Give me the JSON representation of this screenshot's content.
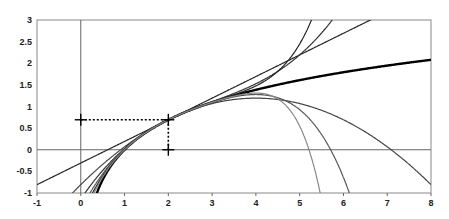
{
  "chart_data": {
    "type": "line",
    "title": "",
    "xlabel": "",
    "ylabel": "",
    "xlim": [
      -1,
      8
    ],
    "ylim": [
      -1,
      3
    ],
    "x_ticks": [
      "-1",
      "0",
      "1",
      "2",
      "3",
      "4",
      "5",
      "6",
      "7",
      "8"
    ],
    "y_ticks": [
      "3",
      "2.5",
      "2",
      "1.5",
      "1",
      "0.5",
      "0",
      "-0.5",
      "-1"
    ],
    "grid": false,
    "legend": null,
    "center_point": {
      "x": 2,
      "y": 0.693
    },
    "series": [
      {
        "name": "ln(x)",
        "order": 0,
        "style": "thick",
        "color": "#000000"
      },
      {
        "name": "T1",
        "order": 1,
        "color": "#222222"
      },
      {
        "name": "T2",
        "order": 2,
        "color": "#444444"
      },
      {
        "name": "T3",
        "order": 3,
        "color": "#333333"
      },
      {
        "name": "T4",
        "order": 4,
        "color": "#555555"
      },
      {
        "name": "T5",
        "order": 5,
        "color": "#222222"
      },
      {
        "name": "T6",
        "order": 6,
        "color": "#888888"
      }
    ]
  }
}
